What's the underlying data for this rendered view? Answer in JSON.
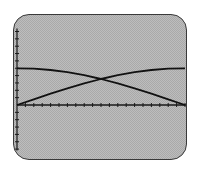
{
  "screen": {
    "background": "#bdbdbd",
    "border_color": "#3a3a3a"
  },
  "chart_data": {
    "type": "line",
    "title": "",
    "xlabel": "",
    "ylabel": "",
    "grid": false,
    "legend": null,
    "xlim": [
      0,
      20
    ],
    "ylim": [
      -6,
      10
    ],
    "x_ticks": 20,
    "y_ticks_above": 10,
    "y_ticks_below": 6,
    "series": [
      {
        "name": "curve-decreasing",
        "description": "starts at 5, decreases to 0 (cosine-like)",
        "x": [
          0,
          2,
          4,
          6,
          8,
          10,
          12,
          14,
          16,
          18,
          20
        ],
        "y": [
          5.0,
          4.94,
          4.76,
          4.46,
          4.05,
          3.54,
          2.94,
          2.27,
          1.55,
          0.78,
          0.0
        ]
      },
      {
        "name": "curve-increasing",
        "description": "starts at 0, increases to 5 (sine-like)",
        "x": [
          0,
          2,
          4,
          6,
          8,
          10,
          12,
          14,
          16,
          18,
          20
        ],
        "y": [
          0.0,
          0.78,
          1.55,
          2.27,
          2.94,
          3.54,
          4.05,
          4.46,
          4.76,
          4.94,
          5.0
        ]
      }
    ],
    "annotations": [
      {
        "type": "intersection",
        "x": 10,
        "y": 3.54
      }
    ]
  }
}
